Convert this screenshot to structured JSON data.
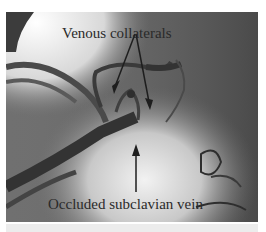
{
  "figure": {
    "type": "angiography-xray",
    "annotations": {
      "top_label": "Venous collaterals",
      "bottom_label": "Occluded subclavian vein"
    },
    "colors": {
      "background_dark": "#5a5a5a",
      "bright_region": "#e8e8e8",
      "vessel": "#3a3a3a",
      "arrow": "#1e1e1e"
    }
  }
}
